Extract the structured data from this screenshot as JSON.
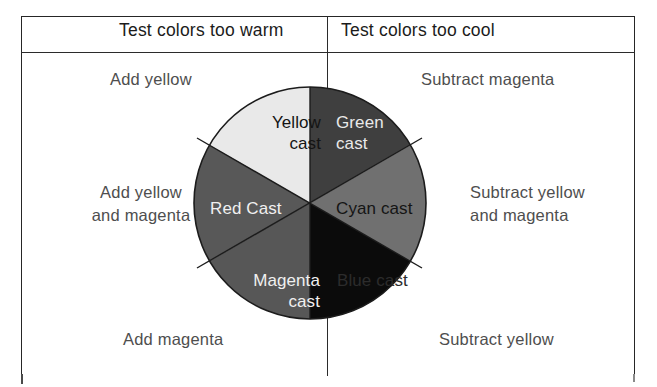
{
  "figure": {
    "title_warm": "Test colors too warm",
    "title_cool": "Test colors too cool",
    "notes": {
      "top_left": "Add yellow",
      "middle_left_line1": "Add yellow",
      "middle_left_line2": "and magenta",
      "bottom_left": "Add magenta",
      "top_right": "Subtract magenta",
      "middle_right_line1": "Subtract yellow",
      "middle_right_line2": "and magenta",
      "bottom_right": "Subtract yellow"
    },
    "wheel": {
      "sectors": [
        {
          "id": "yellow",
          "label_line1": "Yellow",
          "label_line2": "cast",
          "fill": "#e9e9e9",
          "text_color": "#141414",
          "start_angle": -90,
          "end_angle": -30
        },
        {
          "id": "green",
          "label_line1": "Green",
          "label_line2": "cast",
          "fill": "#3f3f3f",
          "text_color": "#e9e9e9",
          "start_angle": -90,
          "end_angle": -30
        },
        {
          "id": "red",
          "label_line1": "Red Cast",
          "label_line2": "",
          "fill": "#585858",
          "text_color": "#f0f0f0",
          "start_angle": 150,
          "end_angle": 210
        },
        {
          "id": "cyan",
          "label_line1": "Cyan cast",
          "label_line2": "",
          "fill": "#707070",
          "text_color": "#151515",
          "start_angle": -30,
          "end_angle": 30
        },
        {
          "id": "magenta",
          "label_line1": "Magenta",
          "label_line2": "cast",
          "fill": "#575757",
          "text_color": "#f0f0f0",
          "start_angle": 90,
          "end_angle": 150
        },
        {
          "id": "blue",
          "label_line1": "Blue cast",
          "label_line2": "",
          "fill": "#0b0b0b",
          "text_color": "#2c2c2c",
          "start_angle": 30,
          "end_angle": 90
        }
      ]
    }
  }
}
